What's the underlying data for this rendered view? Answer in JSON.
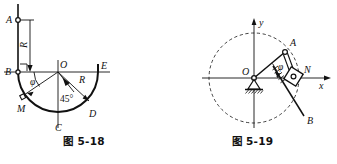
{
  "page": {
    "background": "#ffffff",
    "ink": "#111111",
    "width": 337,
    "height": 164
  },
  "figures": [
    {
      "id": "fig-5-18",
      "caption": "图 5-18",
      "description": "Semicircular bowl / circular groove with radius R, bead at M",
      "labels": {
        "A": "A",
        "B": "B",
        "M": "M",
        "C": "C",
        "D": "D",
        "E": "E",
        "O": "O",
        "R_vertical": "R",
        "R_radial": "R",
        "phi": "φ",
        "angle45": "45°"
      }
    },
    {
      "id": "fig-5-19",
      "caption": "图 5-19",
      "description": "Crank OA rotating in dashed circle driving slider block N along bar toward B, on xy axes",
      "labels": {
        "O": "O",
        "A": "A",
        "N": "N",
        "B": "B",
        "x_axis": "x",
        "y_axis": "y",
        "phi": "φ"
      }
    }
  ]
}
